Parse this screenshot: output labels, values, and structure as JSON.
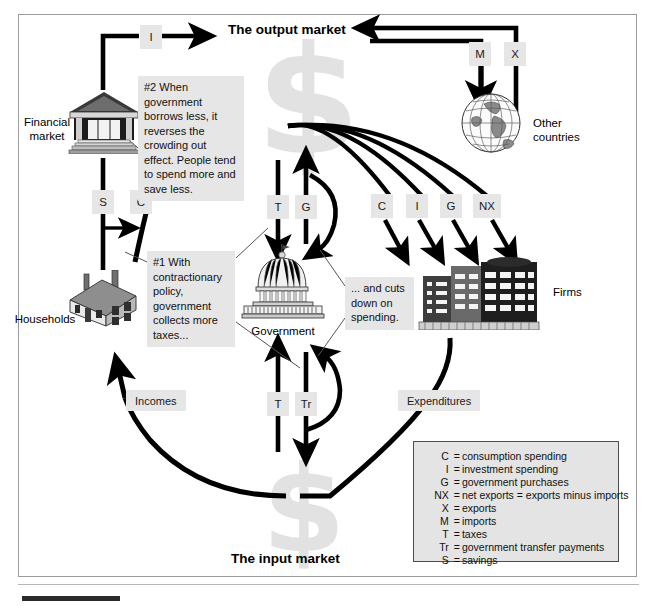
{
  "diagram": {
    "output_market_title": "The output market",
    "input_market_title": "The input market",
    "watermark_symbol": "$"
  },
  "entities": [
    {
      "id": "financial-market",
      "caption": "Financial\nmarket"
    },
    {
      "id": "households",
      "caption": "Households"
    },
    {
      "id": "government",
      "caption": "Government"
    },
    {
      "id": "firms",
      "caption": "Firms"
    },
    {
      "id": "other-countries",
      "caption": "Other\ncountries"
    }
  ],
  "flow_labels": {
    "investment_top": "I",
    "imports": "M",
    "exports": "X",
    "savings": "S",
    "consumption_hh": "C",
    "taxes_top": "T",
    "gov_purchases_top": "G",
    "consumption_firms": "C",
    "investment_firms": "I",
    "gov_purchases_firms": "G",
    "net_exports_firms": "NX",
    "taxes_bottom": "T",
    "transfers": "Tr",
    "incomes": "Incomes",
    "expenditures": "Expenditures"
  },
  "notes": {
    "note_1": "#1 With contractionary policy, government collects more taxes...",
    "note_2": "#2 When government borrows less, it reverses the crowding out effect. People tend to spend more and save less.",
    "note_3": "... and cuts down on spending."
  },
  "legend": {
    "rows": [
      {
        "symbol": "C",
        "equals": "=",
        "definition": "consumption spending"
      },
      {
        "symbol": "I",
        "equals": "=",
        "definition": "investment spending"
      },
      {
        "symbol": "G",
        "equals": "=",
        "definition": "government purchases"
      },
      {
        "symbol": "NX",
        "equals": "=",
        "definition": "net exports = exports minus imports"
      },
      {
        "symbol": "X",
        "equals": "=",
        "definition": "exports",
        "indent": true
      },
      {
        "symbol": "M",
        "equals": "=",
        "definition": "imports",
        "indent": true
      },
      {
        "symbol": "T",
        "equals": "=",
        "definition": "taxes"
      },
      {
        "symbol": "Tr",
        "equals": "=",
        "definition": "government transfer payments"
      },
      {
        "symbol": "S",
        "equals": "=",
        "definition": "savings"
      }
    ]
  },
  "colors": {
    "ink": "#000000",
    "chip_gray": "#e6e6e6",
    "note_gray": "#e6e6e6",
    "legend_gray": "#e4e4e4",
    "watermark_gray": "#e2e2e2",
    "frame_border": "#9b9b9b",
    "legend_border": "#4d4d4d"
  }
}
